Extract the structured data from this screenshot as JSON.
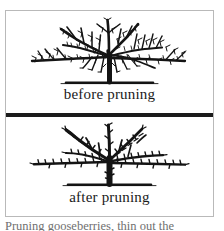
{
  "figure": {
    "background_color": "#ffffff",
    "frame_color": "#b9b9b9",
    "ink_color": "#1a1a1a",
    "divider_color": "#1b1b1b"
  },
  "panels": [
    {
      "id": "before",
      "caption": "before pruning",
      "illustration_name": "gooseberry-bush-unpruned",
      "description": "Densely branched gooseberry bush with many crowded, crossing shoots and fine twigs, standing on a ground line"
    },
    {
      "id": "after",
      "caption": "after pruning",
      "illustration_name": "gooseberry-bush-pruned",
      "description": "Open-centred gooseberry bush with fewer, well-spaced main branches and short fruiting spurs, standing on a ground line"
    }
  ],
  "body_text": {
    "line": "Pruning gooseberries, thin out the"
  }
}
